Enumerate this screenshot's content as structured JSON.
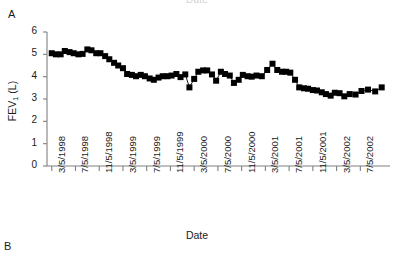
{
  "figure": {
    "cutoff_title_above": "Date",
    "panel_a_letter": "A",
    "panel_b_letter": "B"
  },
  "colors": {
    "marker": "#000000",
    "line": "#000000",
    "axis": "#808080",
    "text": "#1a1a1a",
    "background": "#ffffff"
  },
  "chart_data": {
    "type": "line",
    "title": "",
    "xlabel": "Date",
    "ylabel": "FEV1 (L)",
    "ylabel_display": "FEV",
    "ylabel_sub": "1",
    "ylabel_unit": " (L)",
    "ylim": [
      0,
      6
    ],
    "yticks": [
      0,
      1,
      2,
      3,
      4,
      5,
      6
    ],
    "ytick_labels": [
      "0",
      "1",
      "2",
      "3",
      "4",
      "5",
      "6"
    ],
    "grid": false,
    "legend": false,
    "marker": "filled-square",
    "marker_size_px": 6,
    "xtick_labels": [
      "3/5/1998",
      "7/5/1998",
      "11/5/1998",
      "3/5/1999",
      "7/5/1999",
      "11/5/1999",
      "3/5/2000",
      "7/5/2000",
      "11/5/2000",
      "3/5/2001",
      "7/5/2001",
      "11/5/2001",
      "3/5/2002",
      "7/5/2002"
    ],
    "xtick_positions": [
      0,
      4,
      8,
      12,
      16,
      20,
      24,
      28,
      32,
      36,
      40,
      44,
      48,
      52
    ],
    "xlim": [
      -0.8,
      57
    ],
    "x_unit": "months since 3/5/1998",
    "series": [
      {
        "name": "FEV1",
        "x": [
          0.0,
          0.7,
          1.5,
          2.2,
          3.0,
          3.7,
          4.5,
          5.2,
          6.0,
          6.7,
          7.5,
          8.2,
          9.0,
          9.7,
          10.5,
          11.2,
          12.0,
          12.7,
          13.5,
          14.2,
          15.0,
          15.7,
          16.5,
          17.2,
          18.0,
          18.7,
          19.5,
          20.2,
          21.0,
          21.7,
          22.5,
          23.2,
          24.0,
          24.7,
          25.5,
          26.2,
          27.0,
          27.7,
          28.5,
          29.2,
          30.0,
          30.7,
          31.5,
          32.2,
          33.0,
          33.7,
          34.5,
          35.4,
          36.3,
          37.2,
          38.0,
          38.8,
          39.5,
          40.2,
          41.0,
          41.7,
          42.5,
          43.2,
          44.0,
          44.7,
          45.5,
          46.2,
          47.0,
          47.7,
          48.5,
          49.3,
          50.2,
          51.2,
          52.2,
          53.3,
          54.5,
          55.6
        ],
        "values": [
          5.05,
          5.0,
          5.0,
          5.15,
          5.1,
          5.05,
          5.0,
          5.02,
          5.22,
          5.18,
          5.05,
          5.05,
          4.92,
          4.78,
          4.62,
          4.5,
          4.38,
          4.12,
          4.08,
          4.02,
          4.08,
          4.02,
          3.92,
          3.86,
          3.96,
          4.02,
          4.02,
          4.05,
          4.12,
          3.98,
          4.1,
          3.52,
          3.9,
          4.22,
          4.28,
          4.28,
          4.1,
          3.82,
          4.22,
          4.12,
          4.05,
          3.72,
          3.86,
          4.08,
          4.02,
          4.0,
          4.05,
          4.02,
          4.3,
          4.58,
          4.3,
          4.22,
          4.22,
          4.18,
          3.86,
          3.52,
          3.48,
          3.46,
          3.4,
          3.38,
          3.3,
          3.22,
          3.15,
          3.28,
          3.26,
          3.12,
          3.22,
          3.2,
          3.36,
          3.42,
          3.34,
          3.52
        ]
      }
    ],
    "annotations": []
  }
}
